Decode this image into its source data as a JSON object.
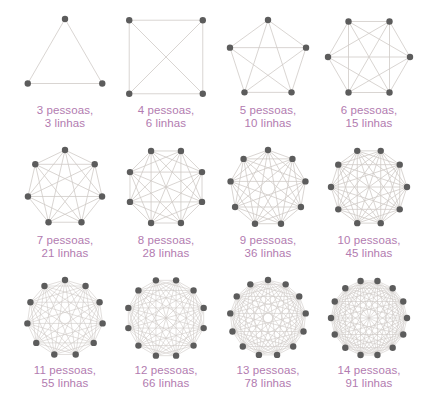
{
  "colors": {
    "edge": "#cfcac6",
    "node": "#5c5c5c",
    "caption": "#b27bb0",
    "background": "#ffffff"
  },
  "graphs": [
    {
      "people": 3,
      "lines": 3,
      "line1": "3 pessoas,",
      "line2": "3 linhas",
      "cx": 65,
      "cy": 62,
      "r": 43,
      "rot": -90
    },
    {
      "people": 4,
      "lines": 6,
      "line1": "4 pessoas,",
      "line2": "6 linhas",
      "cx": 166,
      "cy": 57,
      "r": 52,
      "rot": -45
    },
    {
      "people": 5,
      "lines": 10,
      "line1": "5 pessoas,",
      "line2": "10 linhas",
      "cx": 268,
      "cy": 60,
      "r": 40,
      "rot": -90
    },
    {
      "people": 6,
      "lines": 15,
      "line1": "6 pessoas,",
      "line2": "15 linhas",
      "cx": 369,
      "cy": 57,
      "r": 41,
      "rot": 0
    },
    {
      "people": 7,
      "lines": 21,
      "line1": "7 pessoas,",
      "line2": "21 linhas",
      "cx": 65,
      "cy": 188,
      "r": 38,
      "rot": -90
    },
    {
      "people": 8,
      "lines": 28,
      "line1": "8 pessoas,",
      "line2": "28 linhas",
      "cx": 166,
      "cy": 187,
      "r": 39,
      "rot": -67.5
    },
    {
      "people": 9,
      "lines": 36,
      "line1": "9 pessoas,",
      "line2": "36 linhas",
      "cx": 268,
      "cy": 188,
      "r": 38,
      "rot": -90
    },
    {
      "people": 10,
      "lines": 45,
      "line1": "10 pessoas,",
      "line2": "45 linhas",
      "cx": 369,
      "cy": 187,
      "r": 38,
      "rot": -72
    },
    {
      "people": 11,
      "lines": 55,
      "line1": "11 pessoas,",
      "line2": "55 linhas",
      "cx": 65,
      "cy": 318,
      "r": 38,
      "rot": -90
    },
    {
      "people": 12,
      "lines": 66,
      "line1": "12 pessoas,",
      "line2": "66 linhas",
      "cx": 166,
      "cy": 318,
      "r": 39,
      "rot": -75
    },
    {
      "people": 13,
      "lines": 78,
      "line1": "13 pessoas,",
      "line2": "78 linhas",
      "cx": 268,
      "cy": 318,
      "r": 38,
      "rot": -90
    },
    {
      "people": 14,
      "lines": 91,
      "line1": "14 pessoas,",
      "line2": "91 linhas",
      "cx": 369,
      "cy": 318,
      "r": 38,
      "rot": -77.14
    }
  ],
  "captions_y": [
    104,
    104,
    104,
    104,
    234,
    234,
    234,
    234,
    364,
    364,
    364,
    364
  ]
}
